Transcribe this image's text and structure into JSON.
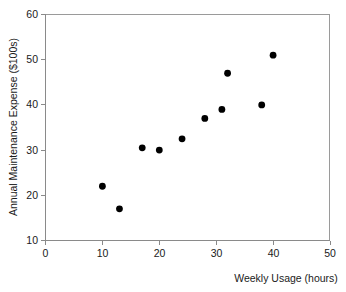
{
  "chart_data": {
    "type": "scatter",
    "title": "",
    "xlabel": "Weekly Usage (hours)",
    "ylabel": "Annual Maintenance Expense ($100s)",
    "xlim": [
      0,
      50
    ],
    "ylim": [
      10,
      60
    ],
    "xticks": [
      0,
      10,
      20,
      30,
      40,
      50
    ],
    "yticks": [
      10,
      20,
      30,
      40,
      50,
      60
    ],
    "xtick_labels": [
      "0",
      "10",
      "20",
      "30",
      "40",
      "50"
    ],
    "ytick_labels": [
      "10",
      "20",
      "30",
      "40",
      "50",
      "60"
    ],
    "grid": false,
    "legend": null,
    "marker": "filled-circle",
    "marker_color": "#000000",
    "points": [
      {
        "x": 10,
        "y": 22
      },
      {
        "x": 13,
        "y": 17
      },
      {
        "x": 17,
        "y": 30.5
      },
      {
        "x": 20,
        "y": 30
      },
      {
        "x": 24,
        "y": 32.5
      },
      {
        "x": 28,
        "y": 37
      },
      {
        "x": 31,
        "y": 39
      },
      {
        "x": 32,
        "y": 47
      },
      {
        "x": 38,
        "y": 40
      },
      {
        "x": 40,
        "y": 51
      }
    ],
    "series": [
      {
        "name": "Maintenance expense vs weekly usage",
        "x": [
          10,
          13,
          17,
          20,
          24,
          28,
          31,
          32,
          38,
          40
        ],
        "values": [
          22,
          17,
          30.5,
          30,
          32.5,
          37,
          39,
          47,
          40,
          51
        ]
      }
    ]
  },
  "axes": {
    "x_title": "Weekly Usage (hours)",
    "y_title": "Annual Maintenance Expense ($100s)"
  }
}
